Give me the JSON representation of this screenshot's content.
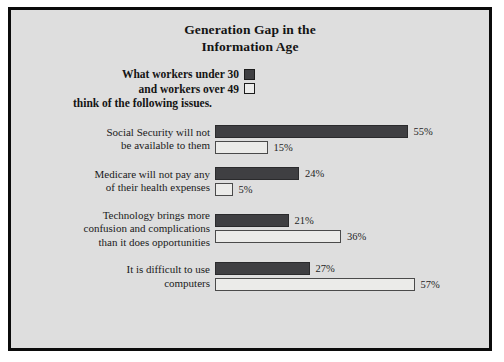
{
  "chart_data": {
    "type": "bar",
    "orientation": "horizontal",
    "title": "Generation Gap in the Information Age",
    "title_lines": [
      "Generation Gap in the",
      "Information Age"
    ],
    "xlabel": "",
    "ylabel": "",
    "xlim": [
      0,
      60
    ],
    "grid": false,
    "legend_position": "top-left",
    "categories": [
      "Social Security will not be available to them",
      "Medicare will not pay any of their health expenses",
      "Technology brings more confusion and complications than it does opportunities",
      "It is difficult to use computers"
    ],
    "category_lines": [
      [
        "Social Security will not",
        "be available to them"
      ],
      [
        "Medicare will not pay any",
        "of their health expenses"
      ],
      [
        "Technology brings more",
        "confusion and complications",
        "than it does opportunities"
      ],
      [
        "It is difficult to use",
        "computers"
      ]
    ],
    "series": [
      {
        "name": "What workers under 30",
        "color": "#3f3f42",
        "values": [
          55,
          24,
          21,
          27
        ],
        "value_labels": [
          "55%",
          "24%",
          "21%",
          "27%"
        ]
      },
      {
        "name": "and workers over 49",
        "color": "#ebebe9",
        "values": [
          15,
          5,
          36,
          57
        ],
        "value_labels": [
          "15%",
          "5%",
          "36%",
          "57%"
        ]
      }
    ]
  },
  "legend": {
    "line1": "What workers under 30",
    "line2": "and workers over 49",
    "line3": "think of the following issues."
  },
  "colors": {
    "panel_background": "#dedede",
    "border": "#0b0b0b",
    "dark_bar": "#3f3f42",
    "light_bar": "#ebebe9",
    "text": "#141414"
  }
}
